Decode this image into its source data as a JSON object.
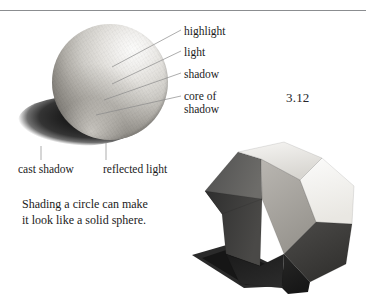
{
  "figure": {
    "number": "3.12",
    "caption": "Shading a circle can make\nit look like a solid sphere."
  },
  "sphere_callouts": [
    {
      "id": "highlight",
      "label": "highlight"
    },
    {
      "id": "light",
      "label": "light"
    },
    {
      "id": "shadow",
      "label": "shadow"
    },
    {
      "id": "core_of_shadow",
      "label": "core of\nshadow"
    }
  ],
  "sphere_under_labels": [
    {
      "id": "cast_shadow",
      "label": "cast shadow"
    },
    {
      "id": "reflected_light",
      "label": "reflected light"
    }
  ],
  "colors": {
    "rule": "#8b8d90",
    "text": "#1b1b1b",
    "leader_line": "#8a8a8a",
    "sphere_highlight": "#fbfbfa",
    "sphere_core_shadow": "#4a4743",
    "cast_shadow": "#1e1e1e",
    "solid_face_light": "#f2f1ef",
    "solid_face_mid": "#a8a5a0",
    "solid_face_dark": "#3a3a3a",
    "solid_face_darkest": "#1d1d1d"
  }
}
